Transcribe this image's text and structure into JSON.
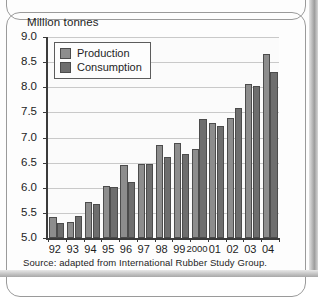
{
  "figure": {
    "y_axis_title": "Million tonnes",
    "source_note": "Source: adapted from International Rubber Study Group."
  },
  "legend": {
    "position": "top-left-inside",
    "entries": [
      {
        "label": "Production",
        "color": "#8d8d8d"
      },
      {
        "label": "Consumption",
        "color": "#6e6e6e"
      }
    ]
  },
  "chart_data": {
    "type": "bar",
    "title": "",
    "subtitle": "",
    "xlabel": "",
    "ylabel": "Million tonnes",
    "ylim": [
      5.0,
      9.0
    ],
    "ytick_step": 0.5,
    "ytick_labels": [
      "9.0",
      "8.5",
      "8.0",
      "7.5",
      "7.0",
      "6.5",
      "6.0",
      "5.5",
      "5.0"
    ],
    "ytick_values": [
      9.0,
      8.5,
      8.0,
      7.5,
      7.0,
      6.5,
      6.0,
      5.5,
      5.0
    ],
    "grid": true,
    "grid_axis": "y",
    "categories": [
      "92",
      "93",
      "94",
      "95",
      "96",
      "97",
      "98",
      "99",
      "2000",
      "01",
      "02",
      "03",
      "04"
    ],
    "series": [
      {
        "name": "Production",
        "color": "#8d8d8d",
        "values": [
          5.42,
          5.31,
          5.71,
          6.03,
          6.46,
          6.48,
          6.86,
          6.9,
          6.78,
          7.29,
          7.39,
          8.07,
          8.66
        ]
      },
      {
        "name": "Consumption",
        "color": "#6e6e6e",
        "values": [
          5.3,
          5.43,
          5.67,
          6.01,
          6.12,
          6.48,
          6.62,
          6.68,
          7.36,
          7.23,
          7.59,
          8.02,
          8.3
        ]
      }
    ],
    "annotations": []
  }
}
